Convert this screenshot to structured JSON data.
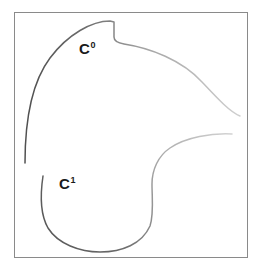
{
  "figure": {
    "frame": {
      "border_color": "#8a8a8a",
      "background_color": "#ffffff",
      "x": 14,
      "y": 12,
      "width": 234,
      "height": 246
    },
    "labels": [
      {
        "id": "c0",
        "base": "C",
        "superscript": "0",
        "text": "C0",
        "x": 79,
        "y": 41,
        "color": "#1a1a1a"
      },
      {
        "id": "c1",
        "base": "C",
        "superscript": "1",
        "text": "C1",
        "x": 59,
        "y": 176,
        "color": "#1a1a1a"
      }
    ],
    "gradient": {
      "dark_color": "#555555",
      "light_color": "#c9c9c9",
      "description": "stroke darkens toward the left end of each curve"
    }
  },
  "chart_data": {
    "type": "line",
    "xlabel": "",
    "ylabel": "",
    "xlim": [
      14,
      248
    ],
    "ylim": [
      12,
      258
    ],
    "grid": false,
    "legend": "none",
    "annotations": [
      {
        "text": "C0",
        "x": 79,
        "y": 41
      },
      {
        "text": "C1",
        "x": 59,
        "y": 176
      }
    ],
    "series": [
      {
        "name": "C0",
        "stroke_start_color": "#555555",
        "stroke_end_color": "#c9c9c9",
        "path": "M 25,163 C 25,120 32,82 50,58 C 68,34 92,21 110,21 L 114,22 L 114,37 C 114,41 118,43 124,44 C 150,48 182,60 202,82 C 218,99 230,112 240,116",
        "x": [
          25,
          28,
          36,
          50,
          68,
          90,
          110,
          114,
          114,
          124,
          150,
          182,
          202,
          222,
          240
        ],
        "y": [
          163,
          140,
          110,
          58,
          34,
          23,
          21,
          22,
          37,
          44,
          48,
          60,
          82,
          101,
          116
        ]
      },
      {
        "name": "C1",
        "stroke_start_color": "#555555",
        "stroke_end_color": "#c9c9c9",
        "path": "M 43,176 C 40,196 40,214 48,228 C 58,244 80,252 100,252 C 122,252 142,244 150,226 C 154,214 152,198 152,184 C 152,170 158,156 170,148 C 186,137 212,133 232,134",
        "x": [
          43,
          41,
          44,
          58,
          80,
          100,
          122,
          142,
          150,
          152,
          152,
          158,
          170,
          196,
          232
        ],
        "y": [
          176,
          196,
          216,
          240,
          252,
          252,
          252,
          244,
          226,
          206,
          184,
          164,
          148,
          138,
          134
        ]
      }
    ]
  }
}
